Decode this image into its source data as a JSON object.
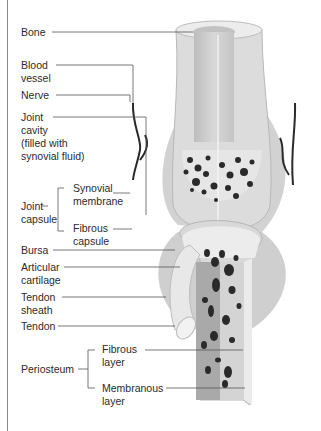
{
  "diagram": {
    "labels": {
      "bone": "Bone",
      "blood_vessel": "Blood\nvessel",
      "nerve": "Nerve",
      "joint_cavity": "Joint\ncavity\n(filled with\nsynovial fluid)",
      "joint_capsule": "Joint\ncapsule",
      "synovial_membrane": "Synovial\nmembrane",
      "fibrous_capsule": "Fibrous\ncapsule",
      "bursa": "Bursa",
      "articular_cartilage": "Articular\ncartilage",
      "tendon_sheath": "Tendon\nsheath",
      "tendon": "Tendon",
      "periosteum": "Periosteum",
      "fibrous_layer": "Fibrous\nlayer",
      "membranous_layer": "Membranous\nlayer"
    },
    "colors": {
      "bone_light": "#e4e4e4",
      "bone_mid": "#c8c8c8",
      "bone_dark": "#a9a9a9",
      "spongy_holes": "#2a2a2a",
      "leader_line": "#555555",
      "text": "#2b2b2b"
    }
  }
}
